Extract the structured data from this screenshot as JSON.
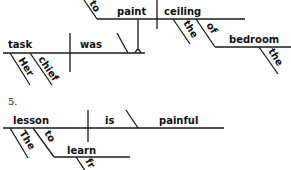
{
  "diagram": {
    "type": "sentence-diagram",
    "sentence_4": {
      "subject": "task",
      "subject_modifiers": [
        "Her",
        "chief"
      ],
      "verb": "was",
      "infinitive_marker": "to",
      "infinitive_verb": "paint",
      "object": "ceiling",
      "object_modifier": "the",
      "preposition": "of",
      "prepositional_object": "bedroom",
      "prepositional_object_modifier": "the"
    },
    "sentence_5": {
      "number": "5.",
      "subject": "lesson",
      "subject_modifiers": [
        "The"
      ],
      "infinitive_marker": "to",
      "infinitive_verb": "learn",
      "infinitive_partial_modifier": "fr",
      "verb": "is",
      "predicate_adjective": "painful"
    }
  }
}
